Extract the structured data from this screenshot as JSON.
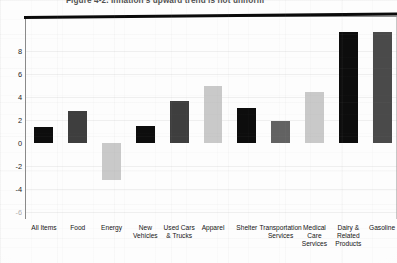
{
  "figure": {
    "title_visible_fragment": "Figure 4-2. Inflation's upward trend is not uniform"
  },
  "axis": {
    "y_ticks": [
      {
        "value": 8,
        "label": "8",
        "faint": false
      },
      {
        "value": 6,
        "label": "6",
        "faint": false
      },
      {
        "value": 4,
        "label": "4",
        "faint": false
      },
      {
        "value": 2,
        "label": "2",
        "faint": false
      },
      {
        "value": 0,
        "label": "0",
        "faint": false
      },
      {
        "value": -2,
        "label": "-2",
        "faint": false
      },
      {
        "value": -4,
        "label": "-4",
        "faint": false
      },
      {
        "value": -6,
        "label": "-6",
        "faint": true
      }
    ],
    "y_min": -6,
    "y_max": 9.2
  },
  "colors": {
    "black": "#0d0d0d",
    "dark_gray": "#3e3e3e",
    "mid_gray": "#626262",
    "light_gray": "#c9c9c9",
    "baseline": "#0a0a0a",
    "frame": "#8e8e8e",
    "text": "#141414"
  },
  "chart_data": {
    "type": "bar",
    "xlabel": "",
    "ylabel": "",
    "ylim": [
      -6,
      9.2
    ],
    "grid": false,
    "legend": "none",
    "units": "percent change",
    "categories": [
      "All Items",
      "Food",
      "Energy",
      "New Vehicles",
      "Used Cars & Trucks",
      "Apparel",
      "Shelter",
      "Transportation Services",
      "Medical Care Services",
      "Dairy & Related Products",
      "Gasoline"
    ],
    "category_lines": [
      [
        "All Items"
      ],
      [
        "Food"
      ],
      [
        "Energy"
      ],
      [
        "New",
        "Vehicles"
      ],
      [
        "Used Cars",
        "& Trucks"
      ],
      [
        "Apparel"
      ],
      [
        "Shelter"
      ],
      [
        "Transportation",
        "Services"
      ],
      [
        "Medical",
        "Care",
        "Services"
      ],
      [
        "Dairy &",
        "Related",
        "Products"
      ],
      [
        "Gasoline"
      ]
    ],
    "values": [
      1.4,
      2.8,
      -3.2,
      1.5,
      3.6,
      4.9,
      3.0,
      1.9,
      4.4,
      9.6,
      9.6
    ],
    "clipped_above_axis": [
      false,
      false,
      false,
      false,
      false,
      false,
      false,
      false,
      false,
      true,
      true
    ],
    "bar_colors": [
      "#0d0d0d",
      "#3e3e3e",
      "#c9c9c9",
      "#0d0d0d",
      "#3e3e3e",
      "#c9c9c9",
      "#0d0d0d",
      "#626262",
      "#c9c9c9",
      "#0d0d0d",
      "#4a4a4a"
    ]
  }
}
